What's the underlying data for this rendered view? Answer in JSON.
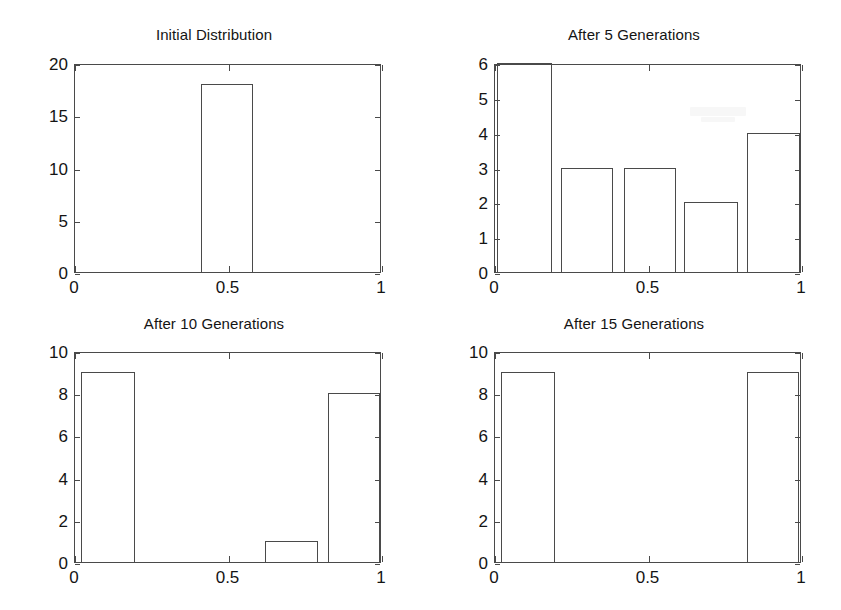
{
  "figure": {
    "width": 841,
    "height": 610,
    "background": "#ffffff",
    "axis_color": "#4a4a4a",
    "text_color": "#141414",
    "layout": "2x2 subplot grid"
  },
  "chart_data": [
    {
      "type": "bar",
      "title": "Initial Distribution",
      "xlabel": "",
      "ylabel": "",
      "xlim": [
        0,
        1
      ],
      "ylim": [
        0,
        20
      ],
      "xticks": [
        0,
        0.5,
        1
      ],
      "xticklabels": [
        "0",
        "0.5",
        "1"
      ],
      "yticks": [
        0,
        5,
        10,
        15,
        20
      ],
      "yticklabels": [
        "0",
        "5",
        "10",
        "15",
        "20"
      ],
      "grid": false,
      "legend": null,
      "bars": [
        {
          "x_start": 0.41,
          "x_end": 0.58,
          "value": 18
        }
      ],
      "bin_edges": [
        0.41,
        0.58
      ],
      "values": [
        18
      ]
    },
    {
      "type": "bar",
      "title": "After 5 Generations",
      "xlabel": "",
      "ylabel": "",
      "xlim": [
        0,
        1
      ],
      "ylim": [
        0,
        6
      ],
      "xticks": [
        0,
        0.5,
        1
      ],
      "xticklabels": [
        "0",
        "0.5",
        "1"
      ],
      "yticks": [
        0,
        1,
        2,
        3,
        4,
        5,
        6
      ],
      "yticklabels": [
        "0",
        "1",
        "2",
        "3",
        "4",
        "5",
        "6"
      ],
      "grid": false,
      "legend": null,
      "bars": [
        {
          "x_start": 0.005,
          "x_end": 0.185,
          "value": 6
        },
        {
          "x_start": 0.215,
          "x_end": 0.385,
          "value": 3
        },
        {
          "x_start": 0.42,
          "x_end": 0.59,
          "value": 3
        },
        {
          "x_start": 0.615,
          "x_end": 0.79,
          "value": 2
        },
        {
          "x_start": 0.82,
          "x_end": 0.995,
          "value": 4
        }
      ],
      "values": [
        6,
        3,
        3,
        2,
        4
      ]
    },
    {
      "type": "bar",
      "title": "After 10 Generations",
      "xlabel": "",
      "ylabel": "",
      "xlim": [
        0,
        1
      ],
      "ylim": [
        0,
        10
      ],
      "xticks": [
        0,
        0.5,
        1
      ],
      "xticklabels": [
        "0",
        "0.5",
        "1"
      ],
      "yticks": [
        0,
        2,
        4,
        6,
        8,
        10
      ],
      "yticklabels": [
        "0",
        "2",
        "4",
        "6",
        "8",
        "10"
      ],
      "grid": false,
      "legend": null,
      "bars": [
        {
          "x_start": 0.02,
          "x_end": 0.195,
          "value": 9
        },
        {
          "x_start": 0.62,
          "x_end": 0.79,
          "value": 1
        },
        {
          "x_start": 0.825,
          "x_end": 0.995,
          "value": 8
        }
      ],
      "values": [
        9,
        1,
        8
      ]
    },
    {
      "type": "bar",
      "title": "After 15 Generations",
      "xlabel": "",
      "ylabel": "",
      "xlim": [
        0,
        1
      ],
      "ylim": [
        0,
        10
      ],
      "xticks": [
        0,
        0.5,
        1
      ],
      "xticklabels": [
        "0",
        "0.5",
        "1"
      ],
      "yticks": [
        0,
        2,
        4,
        6,
        8,
        10
      ],
      "yticklabels": [
        "0",
        "2",
        "4",
        "6",
        "8",
        "10"
      ],
      "grid": false,
      "legend": null,
      "bars": [
        {
          "x_start": 0.02,
          "x_end": 0.195,
          "value": 9
        },
        {
          "x_start": 0.82,
          "x_end": 0.99,
          "value": 9
        }
      ],
      "values": [
        9,
        9
      ]
    }
  ]
}
